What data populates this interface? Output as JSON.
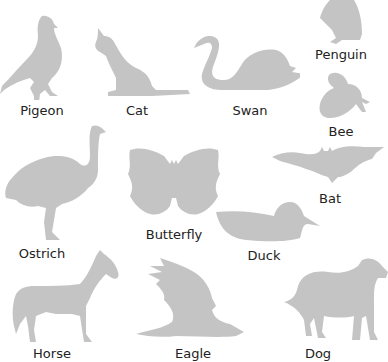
{
  "page": {
    "background": "#ffffff",
    "silhouette_color": "#c4c4c4",
    "label_color": "#222222"
  },
  "animals": [
    {
      "name": "Pigeon",
      "icon": "pigeon-silhouette"
    },
    {
      "name": "Cat",
      "icon": "cat-silhouette"
    },
    {
      "name": "Swan",
      "icon": "swan-silhouette"
    },
    {
      "name": "Penguin",
      "icon": "penguin-silhouette"
    },
    {
      "name": "Bee",
      "icon": "bee-silhouette"
    },
    {
      "name": "Bat",
      "icon": "bat-silhouette"
    },
    {
      "name": "Ostrich",
      "icon": "ostrich-silhouette"
    },
    {
      "name": "Butterfly",
      "icon": "butterfly-silhouette"
    },
    {
      "name": "Duck",
      "icon": "duck-silhouette"
    },
    {
      "name": "Horse",
      "icon": "horse-silhouette"
    },
    {
      "name": "Eagle",
      "icon": "eagle-silhouette"
    },
    {
      "name": "Dog",
      "icon": "dog-silhouette"
    }
  ]
}
